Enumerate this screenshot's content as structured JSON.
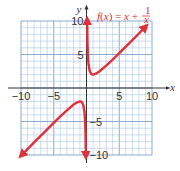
{
  "chart_data": {
    "type": "line",
    "title": "",
    "function_label": "f(x) = x + 1/x",
    "function_label_parts": {
      "lhs": "f(x) = x +",
      "numerator": "1",
      "denominator": "x"
    },
    "xlabel": "x",
    "ylabel": "y",
    "xlim": [
      -10,
      10
    ],
    "ylim": [
      -10,
      10
    ],
    "grid": true,
    "grid_step": 1,
    "x_ticks": [
      {
        "value": -10,
        "label": "−10"
      },
      {
        "value": -5,
        "label": "−5"
      },
      {
        "value": 5,
        "label": "5"
      },
      {
        "value": 10,
        "label": "10"
      }
    ],
    "y_ticks": [
      {
        "value": 10,
        "label": "10"
      },
      {
        "value": 5,
        "label": "5"
      },
      {
        "value": -5,
        "label": "−5"
      },
      {
        "value": -10,
        "label": "−10"
      }
    ],
    "series": [
      {
        "name": "f(x) = x + 1/x (x > 0)",
        "x": [
          0.1,
          0.15,
          0.2,
          0.3,
          0.5,
          0.75,
          1,
          1.5,
          2,
          3,
          4,
          5,
          6,
          7,
          8,
          9
        ],
        "y": [
          10.1,
          6.82,
          5.2,
          3.63,
          2.5,
          2.08,
          2,
          2.17,
          2.5,
          3.33,
          4.25,
          5.2,
          6.17,
          7.14,
          8.13,
          9.11
        ]
      },
      {
        "name": "f(x) = x + 1/x (x < 0)",
        "x": [
          -9.9,
          -9,
          -8,
          -7,
          -6,
          -5,
          -4,
          -3,
          -2,
          -1.5,
          -1,
          -0.75,
          -0.5,
          -0.3,
          -0.2,
          -0.15,
          -0.1
        ],
        "y": [
          -10.0,
          -9.11,
          -8.13,
          -7.14,
          -6.17,
          -5.2,
          -4.25,
          -3.33,
          -2.5,
          -2.17,
          -2,
          -2.08,
          -2.5,
          -3.63,
          -5.2,
          -6.82,
          -10.1
        ]
      }
    ],
    "asymptotes": [
      "x = 0",
      "y = x"
    ],
    "colors": {
      "curve": "#e0303a",
      "grid_minor": "#a9c4e8",
      "grid_major": "#7f9fcf",
      "axis": "#333333",
      "grid_background": "#ffffff"
    }
  }
}
